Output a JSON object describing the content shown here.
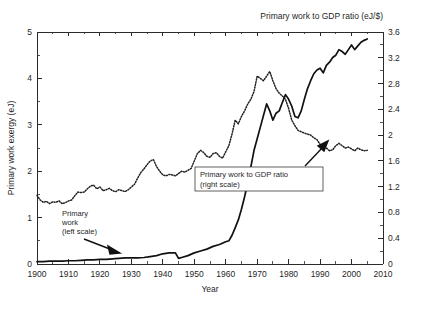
{
  "chart_data": {
    "type": "line",
    "title": "",
    "top_right_title": "Primary work to GDP ratio (eJ/$)",
    "xlabel": "Year",
    "ylabel": "Primary work exergy (eJ)",
    "y2label": "Primary work to GDP ratio (eJ/$)",
    "xlim": [
      1900,
      2010
    ],
    "ylim": [
      0,
      5
    ],
    "y2lim": [
      0,
      3.6
    ],
    "grid": false,
    "legend_position": "inline-annotations",
    "xticks": [
      1900,
      1910,
      1920,
      1930,
      1940,
      1950,
      1960,
      1970,
      1980,
      1990,
      2000,
      2010
    ],
    "xtick_labels": [
      "1900",
      "1910",
      "1920",
      "1930",
      "1940",
      "1950",
      "1960",
      "1970",
      "1980",
      "1990",
      "2000",
      "2010"
    ],
    "xminor_step": 5,
    "yticks": [
      0,
      1,
      2,
      3,
      4,
      5
    ],
    "ytick_labels": [
      "0",
      "1",
      "2",
      "3",
      "4",
      "5"
    ],
    "yminor_step": 0.5,
    "y2ticks": [
      0,
      0.4,
      0.8,
      1.2,
      1.6,
      2,
      2.4,
      2.8,
      3.2,
      3.6
    ],
    "y2tick_labels": [
      "0",
      "0.4",
      "0.8",
      "1.2",
      "1.6",
      "2",
      "2.4",
      "2.8",
      "3.2",
      "3.6"
    ],
    "y2minor_step": 0.2,
    "annotations": [
      {
        "name": "primary-work-annotation",
        "lines": [
          "Primary",
          "work",
          "(left scale)"
        ],
        "boxed": false,
        "text_x": 62,
        "text_y": 216,
        "arrow": {
          "x1": 84,
          "y1": 238,
          "x2": 118,
          "y2": 252
        }
      },
      {
        "name": "ratio-annotation",
        "lines": [
          "Primary work to GDP ratio",
          "(right scale)"
        ],
        "boxed": true,
        "box": {
          "x": 195,
          "y": 167,
          "w": 128,
          "h": 24
        },
        "arrow": {
          "x1": 310,
          "y1": 167,
          "x2": 327,
          "y2": 143
        }
      }
    ],
    "series": [
      {
        "name": "Primary work",
        "axis": "left",
        "unit": "eJ",
        "style": "solid",
        "label": "Primary work (left scale)",
        "x": [
          1900,
          1902,
          1904,
          1906,
          1908,
          1910,
          1912,
          1914,
          1916,
          1918,
          1920,
          1922,
          1924,
          1926,
          1928,
          1930,
          1932,
          1934,
          1936,
          1938,
          1940,
          1942,
          1944,
          1945,
          1946,
          1948,
          1950,
          1952,
          1954,
          1956,
          1958,
          1960,
          1961,
          1962,
          1963,
          1964,
          1965,
          1966,
          1967,
          1968,
          1969,
          1970,
          1971,
          1972,
          1973,
          1974,
          1975,
          1976,
          1977,
          1978,
          1979,
          1980,
          1981,
          1982,
          1983,
          1984,
          1985,
          1986,
          1987,
          1988,
          1989,
          1990,
          1991,
          1992,
          1993,
          1994,
          1995,
          1996,
          1997,
          1998,
          1999,
          2000,
          2001,
          2002,
          2003,
          2004,
          2005
        ],
        "values": [
          0.05,
          0.05,
          0.06,
          0.06,
          0.06,
          0.07,
          0.07,
          0.08,
          0.09,
          0.09,
          0.1,
          0.1,
          0.11,
          0.12,
          0.13,
          0.13,
          0.13,
          0.14,
          0.16,
          0.18,
          0.22,
          0.24,
          0.24,
          0.12,
          0.14,
          0.18,
          0.24,
          0.28,
          0.32,
          0.38,
          0.42,
          0.48,
          0.5,
          0.62,
          0.78,
          0.95,
          1.18,
          1.45,
          1.75,
          2.1,
          2.45,
          2.7,
          2.95,
          3.2,
          3.45,
          3.3,
          3.1,
          3.25,
          3.3,
          3.48,
          3.65,
          3.55,
          3.4,
          3.18,
          3.15,
          3.3,
          3.55,
          3.78,
          3.95,
          4.1,
          4.18,
          4.22,
          4.12,
          4.28,
          4.35,
          4.45,
          4.5,
          4.62,
          4.58,
          4.52,
          4.62,
          4.72,
          4.62,
          4.7,
          4.78,
          4.82,
          4.85
        ]
      },
      {
        "name": "Primary work to GDP ratio",
        "axis": "right",
        "unit": "eJ/$",
        "style": "dotted",
        "label": "Primary work to GDP ratio (right scale)",
        "x": [
          1900,
          1901,
          1902,
          1903,
          1904,
          1905,
          1906,
          1907,
          1908,
          1909,
          1910,
          1911,
          1912,
          1913,
          1914,
          1915,
          1916,
          1917,
          1918,
          1919,
          1920,
          1921,
          1922,
          1923,
          1924,
          1925,
          1926,
          1927,
          1928,
          1929,
          1930,
          1931,
          1932,
          1933,
          1934,
          1935,
          1936,
          1937,
          1938,
          1939,
          1940,
          1941,
          1942,
          1943,
          1944,
          1945,
          1946,
          1947,
          1948,
          1949,
          1950,
          1951,
          1952,
          1953,
          1954,
          1955,
          1956,
          1957,
          1958,
          1959,
          1960,
          1961,
          1962,
          1963,
          1964,
          1965,
          1966,
          1967,
          1968,
          1969,
          1970,
          1971,
          1972,
          1973,
          1974,
          1975,
          1976,
          1977,
          1978,
          1979,
          1980,
          1981,
          1982,
          1983,
          1984,
          1985,
          1986,
          1987,
          1988,
          1989,
          1990,
          1991,
          1992,
          1993,
          1994,
          1995,
          1996,
          1997,
          1998,
          1999,
          2000,
          2001,
          2002,
          2003,
          2004,
          2005
        ],
        "values_left_scale": [
          1.48,
          1.38,
          1.33,
          1.35,
          1.3,
          1.34,
          1.33,
          1.36,
          1.3,
          1.32,
          1.36,
          1.38,
          1.47,
          1.55,
          1.54,
          1.55,
          1.62,
          1.68,
          1.7,
          1.62,
          1.66,
          1.58,
          1.6,
          1.63,
          1.58,
          1.56,
          1.6,
          1.58,
          1.56,
          1.6,
          1.66,
          1.72,
          1.85,
          1.97,
          2.05,
          2.14,
          2.22,
          2.25,
          2.1,
          2.0,
          1.92,
          1.9,
          1.93,
          1.92,
          1.9,
          1.95,
          2.0,
          1.98,
          2.02,
          2.06,
          2.22,
          2.38,
          2.45,
          2.4,
          2.32,
          2.3,
          2.38,
          2.4,
          2.32,
          2.28,
          2.42,
          2.55,
          2.8,
          3.1,
          3.02,
          3.18,
          3.3,
          3.45,
          3.55,
          3.72,
          4.05,
          4.0,
          3.95,
          4.05,
          4.15,
          3.95,
          3.78,
          3.68,
          3.62,
          3.55,
          3.35,
          3.1,
          2.98,
          2.88,
          2.85,
          2.82,
          2.8,
          2.78,
          2.72,
          2.68,
          2.58,
          2.52,
          2.5,
          2.44,
          2.46,
          2.55,
          2.6,
          2.55,
          2.5,
          2.52,
          2.48,
          2.44,
          2.5,
          2.46,
          2.44,
          2.45
        ],
        "values": [
          1.07,
          0.99,
          0.96,
          0.97,
          0.94,
          0.96,
          0.96,
          0.98,
          0.94,
          0.95,
          0.98,
          0.99,
          1.06,
          1.12,
          1.11,
          1.12,
          1.17,
          1.21,
          1.22,
          1.17,
          1.2,
          1.14,
          1.15,
          1.17,
          1.14,
          1.12,
          1.15,
          1.14,
          1.12,
          1.15,
          1.2,
          1.24,
          1.33,
          1.42,
          1.48,
          1.54,
          1.6,
          1.62,
          1.51,
          1.44,
          1.38,
          1.37,
          1.39,
          1.38,
          1.37,
          1.4,
          1.44,
          1.43,
          1.45,
          1.48,
          1.6,
          1.71,
          1.76,
          1.73,
          1.67,
          1.66,
          1.71,
          1.73,
          1.67,
          1.64,
          1.74,
          1.84,
          2.02,
          2.23,
          2.17,
          2.29,
          2.38,
          2.48,
          2.56,
          2.68,
          2.92,
          2.88,
          2.84,
          2.92,
          2.99,
          2.84,
          2.72,
          2.65,
          2.61,
          2.56,
          2.41,
          2.23,
          2.15,
          2.07,
          2.05,
          2.03,
          2.02,
          2.0,
          1.96,
          1.93,
          1.86,
          1.81,
          1.8,
          1.76,
          1.77,
          1.84,
          1.87,
          1.84,
          1.8,
          1.81,
          1.79,
          1.76,
          1.8,
          1.77,
          1.76,
          1.76
        ]
      }
    ]
  },
  "colors": {
    "axis": "#2b2b2b",
    "solid_series": "#111111",
    "dotted_series": "#222222",
    "background": "#ffffff"
  }
}
